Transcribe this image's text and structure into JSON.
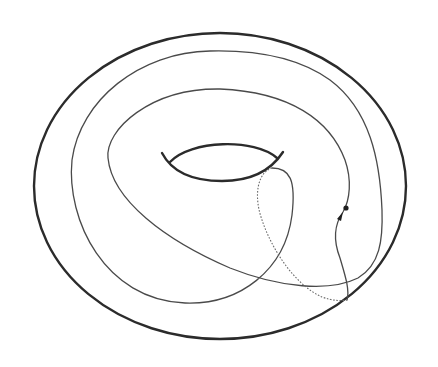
{
  "figure": {
    "stroke_color": "#2b2b2b",
    "curve_color": "#4a4a4a",
    "hidden_segment_color": "#6a6a6a",
    "background": "#ffffff"
  },
  "elements": {
    "outer_boundary": "torus-outline",
    "hole": "torus-hole",
    "curve": "curve-on-torus",
    "hidden_part": "dashed-hidden-segment",
    "markers": [
      "marked-point",
      "direction-arrow"
    ]
  }
}
